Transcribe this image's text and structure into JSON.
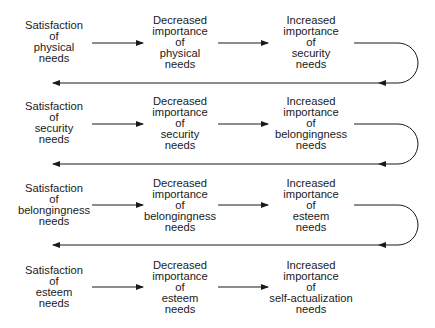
{
  "diagram": {
    "title": "",
    "rows": [
      {
        "stage": 1,
        "y": 43,
        "nodes": [
          {
            "id": "r1c1",
            "text": "Satisfaction\nof\nphysical\nneeds"
          },
          {
            "id": "r1c2",
            "text": "Decreased\nimportance\nof\nphysical\nneeds"
          },
          {
            "id": "r1c3",
            "text": "Increased\nimportance\nof\nsecurity\nneeds"
          }
        ]
      },
      {
        "stage": 2,
        "y": 124,
        "nodes": [
          {
            "id": "r2c1",
            "text": "Satisfaction\nof\nsecurity\nneeds"
          },
          {
            "id": "r2c2",
            "text": "Decreased\nimportance\nof\nsecurity\nneeds"
          },
          {
            "id": "r2c3",
            "text": "Increased\nimportance\nof\nbelongingness\nneeds"
          }
        ]
      },
      {
        "stage": 3,
        "y": 205,
        "nodes": [
          {
            "id": "r3c1",
            "text": "Satisfaction\nof\nbelongingness\nneeds"
          },
          {
            "id": "r3c2",
            "text": "Decreased\nimportance\nof\nbelongingness\nneeds"
          },
          {
            "id": "r3c3",
            "text": "Increased\nimportance\nof\nesteem\nneeds"
          }
        ]
      },
      {
        "stage": 4,
        "y": 287,
        "nodes": [
          {
            "id": "r4c1",
            "text": "Satisfaction\nof\nesteem\nneeds"
          },
          {
            "id": "r4c2",
            "text": "Decreased\nimportance\nof\nesteem\nneeds"
          },
          {
            "id": "r4c3",
            "text": "Increased\nimportance\nof\nself-actualization\nneeds"
          }
        ]
      }
    ],
    "edges": [
      {
        "from": "r1c1",
        "to": "r1c2",
        "type": "arrow"
      },
      {
        "from": "r1c2",
        "to": "r1c3",
        "type": "arrow"
      },
      {
        "from": "r1c3",
        "to": "r2c1",
        "type": "loop-back-arrow"
      },
      {
        "from": "r2c1",
        "to": "r2c2",
        "type": "arrow"
      },
      {
        "from": "r2c2",
        "to": "r2c3",
        "type": "arrow"
      },
      {
        "from": "r2c3",
        "to": "r3c1",
        "type": "loop-back-arrow"
      },
      {
        "from": "r3c1",
        "to": "r3c2",
        "type": "arrow"
      },
      {
        "from": "r3c2",
        "to": "r3c3",
        "type": "arrow"
      },
      {
        "from": "r3c3",
        "to": "r4c1",
        "type": "loop-back-arrow"
      },
      {
        "from": "r4c1",
        "to": "r4c2",
        "type": "arrow"
      },
      {
        "from": "r4c2",
        "to": "r4c3",
        "type": "arrow"
      }
    ],
    "colors": {
      "line": "#1a1a1a",
      "background": "#ffffff"
    }
  }
}
